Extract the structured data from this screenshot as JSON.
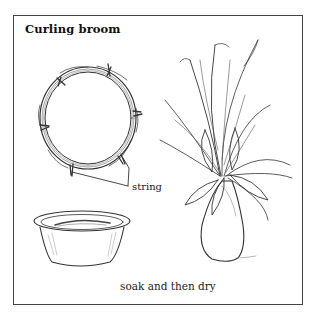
{
  "figure": {
    "title": "Curling broom",
    "labels": {
      "string": "string"
    },
    "caption": "soak and then dry",
    "illustrations": [
      {
        "name": "broom-ring",
        "description": "broom straws bound into a ring with string ties"
      },
      {
        "name": "soaking-bowl",
        "description": "bowl of water with broom straws soaking"
      },
      {
        "name": "vase-with-plumes",
        "description": "vase holding dried curling plumes and leaves"
      }
    ],
    "colors": {
      "ink": "#222222",
      "border": "#444444",
      "background": "#ffffff"
    }
  }
}
